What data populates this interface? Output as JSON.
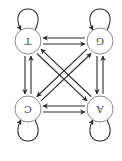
{
  "diagram": {
    "type": "markov-chain",
    "orientation_deg": 180,
    "colors": {
      "edge": "#2b2b2b",
      "node_stroke": "#8a8a8a",
      "node_fill": "#ffffff",
      "label": "#444444",
      "background": "#ffffff"
    },
    "nodes": [
      {
        "id": "A",
        "label": "A",
        "cx": 22,
        "cy": 52,
        "r": 13,
        "loop_side": "top"
      },
      {
        "id": "C",
        "label": "C",
        "cx": 94,
        "cy": 52,
        "r": 13,
        "loop_side": "top"
      },
      {
        "id": "G",
        "label": "G",
        "cx": 22,
        "cy": 120,
        "r": 13,
        "loop_side": "bottom"
      },
      {
        "id": "T",
        "label": "T",
        "cx": 94,
        "cy": 120,
        "r": 13,
        "loop_side": "bottom"
      }
    ],
    "edges": [
      {
        "from": "A",
        "to": "A"
      },
      {
        "from": "C",
        "to": "C"
      },
      {
        "from": "G",
        "to": "G"
      },
      {
        "from": "T",
        "to": "T"
      },
      {
        "from": "A",
        "to": "C"
      },
      {
        "from": "C",
        "to": "A"
      },
      {
        "from": "G",
        "to": "T"
      },
      {
        "from": "T",
        "to": "G"
      },
      {
        "from": "A",
        "to": "G"
      },
      {
        "from": "G",
        "to": "A"
      },
      {
        "from": "C",
        "to": "T"
      },
      {
        "from": "T",
        "to": "C"
      },
      {
        "from": "A",
        "to": "T"
      },
      {
        "from": "T",
        "to": "A"
      },
      {
        "from": "C",
        "to": "G"
      },
      {
        "from": "G",
        "to": "C"
      }
    ]
  }
}
